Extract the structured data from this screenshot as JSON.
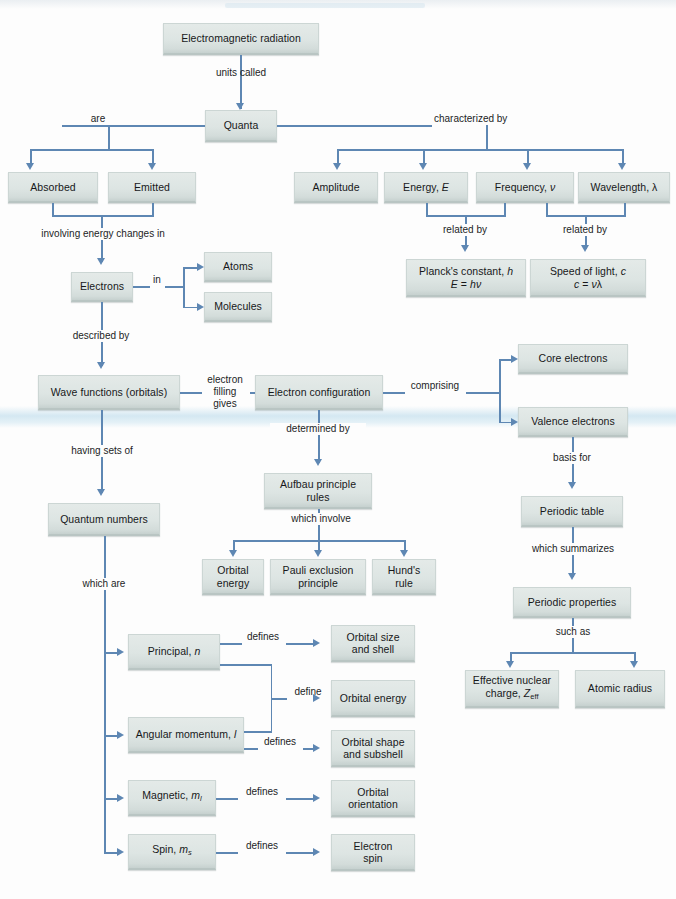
{
  "diagram": {
    "colors": {
      "box_fill": "#dde5e3",
      "box_border": "#ccd6d4",
      "connector": "#5e87b3",
      "text": "#17181a",
      "background": "#fdfdfd",
      "scan_band": "#cde4f0"
    }
  },
  "nodes": {
    "electromagnetic_radiation": "Electromagnetic radiation",
    "quanta": "Quanta",
    "absorbed": "Absorbed",
    "emitted": "Emitted",
    "amplitude": "Amplitude",
    "energy": "Energy, E",
    "frequency": "Frequency, ν",
    "wavelength": "Wavelength, λ",
    "plancks_constant_line1": "Planck's constant, h",
    "plancks_constant_line2": "E = hν",
    "speed_of_light_line1": "Speed of light, c",
    "speed_of_light_line2": "c = νλ",
    "electrons": "Electrons",
    "atoms": "Atoms",
    "molecules": "Molecules",
    "wave_functions": "Wave functions (orbitals)",
    "electron_configuration": "Electron configuration",
    "core_electrons": "Core electrons",
    "valence_electrons": "Valence electrons",
    "aufbau_line1": "Aufbau principle",
    "aufbau_line2": "rules",
    "orbital_energy_rule_line1": "Orbital",
    "orbital_energy_rule_line2": "energy",
    "pauli_line1": "Pauli exclusion",
    "pauli_line2": "principle",
    "hund_line1": "Hund's",
    "hund_line2": "rule",
    "periodic_table": "Periodic table",
    "periodic_properties": "Periodic properties",
    "effective_nuclear_charge_line1": "Effective nuclear",
    "effective_nuclear_charge_line2": "charge, Z_eff",
    "atomic_radius": "Atomic radius",
    "quantum_numbers": "Quantum numbers",
    "principal": "Principal, n",
    "angular_momentum": "Angular momentum, l",
    "magnetic": "Magnetic, m_l",
    "spin": "Spin, m_s",
    "orbital_size_line1": "Orbital size",
    "orbital_size_line2": "and shell",
    "orbital_energy": "Orbital energy",
    "orbital_shape_line1": "Orbital shape",
    "orbital_shape_line2": "and subshell",
    "orbital_orientation_line1": "Orbital",
    "orbital_orientation_line2": "orientation",
    "electron_spin_line1": "Electron",
    "electron_spin_line2": "spin"
  },
  "edge_labels": {
    "units_called": "units called",
    "are": "are",
    "characterized_by": "characterized by",
    "involving_energy_changes_in": "involving energy changes in",
    "in": "in",
    "described_by": "described by",
    "related_by_1": "related by",
    "related_by_2": "related by",
    "electron_filling_gives_l1": "electron",
    "electron_filling_gives_l2": "filling",
    "electron_filling_gives_l3": "gives",
    "comprising": "comprising",
    "determined_by": "determined by",
    "which_involve": "which involve",
    "having_sets_of": "having sets of",
    "which_are": "which are",
    "basis_for": "basis for",
    "which_summarizes": "which summarizes",
    "such_as": "such as",
    "defines_1": "defines",
    "define": "define",
    "defines_2": "defines",
    "defines_3": "defines",
    "defines_4": "defines"
  }
}
